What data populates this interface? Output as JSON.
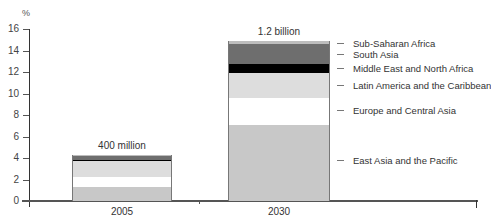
{
  "chart_data": {
    "type": "bar",
    "stacked": true,
    "title": "",
    "xlabel": "",
    "ylabel": "%",
    "ylim": [
      0,
      16
    ],
    "yticks": [
      0,
      2,
      4,
      6,
      8,
      10,
      12,
      14,
      16
    ],
    "grid": false,
    "legend_position": "right (inline labels next to 2030 bar)",
    "categories": [
      "2005",
      "2030"
    ],
    "bar_totals_labels": [
      "400 million",
      "1.2 billion"
    ],
    "series": [
      {
        "name": "East Asia and the Pacific",
        "values": [
          1.3,
          7.1
        ],
        "color": "#c8c8c8"
      },
      {
        "name": "Europe and Central Asia",
        "values": [
          0.9,
          2.5
        ],
        "color": "#ffffff"
      },
      {
        "name": "Latin America and the Caribbean",
        "values": [
          1.5,
          2.3
        ],
        "color": "#dddddd"
      },
      {
        "name": "Middle East and North Africa",
        "values": [
          0.1,
          0.8
        ],
        "color": "#000000"
      },
      {
        "name": "South Asia",
        "values": [
          0.4,
          1.9
        ],
        "color": "#6e6e6e"
      },
      {
        "name": "Sub-Saharan Africa",
        "values": [
          0.1,
          0.3
        ],
        "color": "#bdbdbd"
      }
    ],
    "totals": [
      4.3,
      14.9
    ]
  },
  "axis": {
    "y_unit": "%",
    "y_ticks": [
      "0",
      "2",
      "4",
      "6",
      "8",
      "10",
      "12",
      "14",
      "16"
    ]
  },
  "legend": [
    "Sub-Saharan Africa",
    "South Asia",
    "Middle East and North Africa",
    "Latin America and the Caribbean",
    "Europe and Central Asia",
    "East Asia and the Pacific"
  ]
}
